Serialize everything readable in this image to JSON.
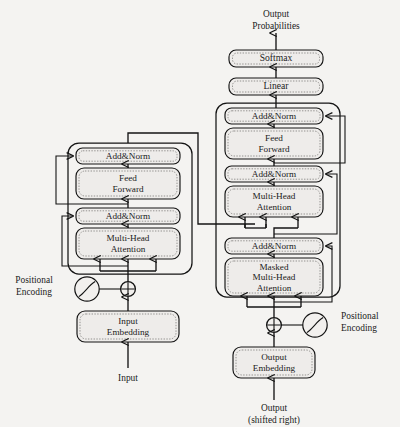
{
  "figure": {
    "background_color": "#f4f3f1",
    "ink_color": "#141414"
  },
  "output_head": {
    "top_label_line1": "Output",
    "top_label_line2": "Probabilities",
    "softmax": "Softmax",
    "linear": "Linear"
  },
  "encoder": {
    "blocks": [
      {
        "name": "add-norm-2",
        "label": "Add&Norm"
      },
      {
        "name": "feed-forward",
        "label_line1": "Feed",
        "label_line2": "Forward"
      },
      {
        "name": "add-norm-1",
        "label": "Add&Norm"
      },
      {
        "name": "multi-head-attention",
        "label_line1": "Multi-Head",
        "label_line2": "Attention"
      }
    ],
    "positional_encoding_line1": "Positional",
    "positional_encoding_line2": "Encoding",
    "embedding_line1": "Input",
    "embedding_line2": "Embedding",
    "input_label": "Input"
  },
  "decoder": {
    "blocks": [
      {
        "name": "add-norm-3",
        "label": "Add&Norm"
      },
      {
        "name": "feed-forward",
        "label_line1": "Feed",
        "label_line2": "Forward"
      },
      {
        "name": "add-norm-2",
        "label": "Add&Norm"
      },
      {
        "name": "multi-head-attention",
        "label_line1": "Multi-Head",
        "label_line2": "Attention"
      },
      {
        "name": "add-norm-1",
        "label": "Add&Norm"
      },
      {
        "name": "masked-multi-head-attention",
        "label_line1": "Masked",
        "label_line2": "Multi-Head",
        "label_line3": "Attention"
      }
    ],
    "positional_encoding_line1": "Positional",
    "positional_encoding_line2": "Encoding",
    "embedding_line1": "Output",
    "embedding_line2": "Embedding",
    "input_label_line1": "Output",
    "input_label_line2": "(shifted right)"
  }
}
